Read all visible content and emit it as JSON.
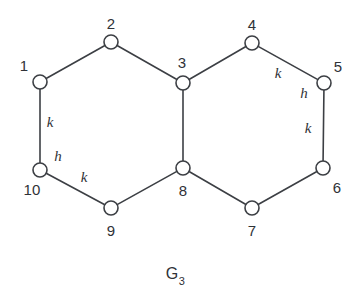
{
  "figure": {
    "caption_base": "G",
    "caption_subscript": "3",
    "caption_full": "G3",
    "background_color": "#ffffff",
    "stroke_color": "#3c3f44",
    "text_color": "#2f3237",
    "vertex_fill": "#ffffff",
    "vertex_radius": 7
  },
  "chart_data": {
    "type": "diagram",
    "title": "G3",
    "vertices": [
      {
        "id": "1",
        "label": "1",
        "x": 40,
        "y": 82,
        "label_x": 24,
        "label_y": 65
      },
      {
        "id": "2",
        "label": "2",
        "x": 111,
        "y": 42,
        "label_x": 111,
        "label_y": 23
      },
      {
        "id": "3",
        "label": "3",
        "x": 183,
        "y": 83,
        "label_x": 182,
        "label_y": 62
      },
      {
        "id": "4",
        "label": "4",
        "x": 252,
        "y": 43,
        "label_x": 252,
        "label_y": 24
      },
      {
        "id": "5",
        "label": "5",
        "x": 324,
        "y": 83,
        "label_x": 338,
        "label_y": 66
      },
      {
        "id": "6",
        "label": "6",
        "x": 323,
        "y": 168,
        "label_x": 337,
        "label_y": 187
      },
      {
        "id": "7",
        "label": "7",
        "x": 252,
        "y": 208,
        "label_x": 252,
        "label_y": 230
      },
      {
        "id": "8",
        "label": "8",
        "x": 183,
        "y": 168,
        "label_x": 183,
        "label_y": 190
      },
      {
        "id": "9",
        "label": "9",
        "x": 111,
        "y": 208,
        "label_x": 111,
        "label_y": 230
      },
      {
        "id": "10",
        "label": "10",
        "x": 40,
        "y": 170,
        "label_x": 32,
        "label_y": 189
      }
    ],
    "edges": [
      {
        "from": "1",
        "to": "2",
        "weight": null
      },
      {
        "from": "2",
        "to": "3",
        "weight": null
      },
      {
        "from": "3",
        "to": "4",
        "weight": null
      },
      {
        "from": "4",
        "to": "5",
        "weight": "k",
        "label_x": 278,
        "label_y": 73
      },
      {
        "from": "5",
        "to": "6",
        "weight": "k",
        "label_x": 308,
        "label_y": 128
      },
      {
        "from": "6",
        "to": "7",
        "weight": null
      },
      {
        "from": "7",
        "to": "8",
        "weight": null
      },
      {
        "from": "8",
        "to": "9",
        "weight": null
      },
      {
        "from": "9",
        "to": "10",
        "weight": "k",
        "label_x": 84,
        "label_y": 177
      },
      {
        "from": "10",
        "to": "1",
        "weight": "k",
        "label_x": 50,
        "label_y": 122
      },
      {
        "from": "3",
        "to": "8",
        "weight": null
      }
    ],
    "extra_labels": [
      {
        "id": "h-left",
        "text": "h",
        "x": 58,
        "y": 156
      },
      {
        "id": "h-right",
        "text": "h",
        "x": 304,
        "y": 93
      }
    ],
    "legend": [],
    "xlabel": "",
    "ylabel": ""
  }
}
